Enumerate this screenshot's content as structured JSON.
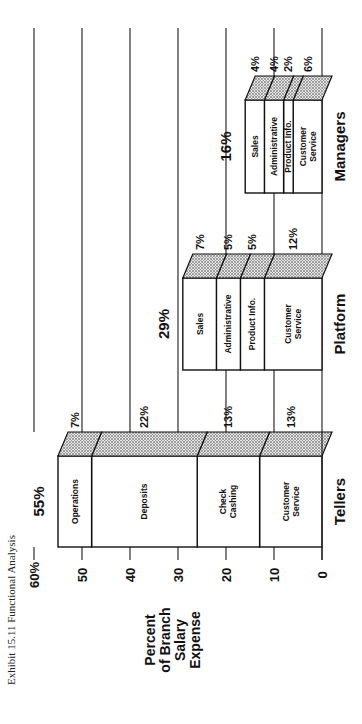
{
  "title": "Exhibit 15.11   Functional Analysis",
  "chart_data": {
    "type": "bar",
    "stacked": true,
    "orientation": "rotated-90",
    "title": "Exhibit 15.11 Functional Analysis",
    "ylabel": "Percent of Branch Salary Expense",
    "ylabel_lines": [
      "Percent",
      "of Branch",
      "Salary",
      "Expense"
    ],
    "xlabel": "",
    "ylim": [
      0,
      60
    ],
    "yticks": [
      "0",
      "10",
      "20",
      "30",
      "40",
      "50",
      "60%"
    ],
    "grid": true,
    "categories": [
      "Tellers",
      "Platform",
      "Managers"
    ],
    "totals": [
      "55%",
      "29%",
      "16%"
    ],
    "bars": [
      {
        "category": "Tellers",
        "total": 55,
        "segments": [
          {
            "name": "Customer Service",
            "lines": [
              "Customer",
              "Service"
            ],
            "value": 13,
            "label": "13%"
          },
          {
            "name": "Check Cashing",
            "lines": [
              "Check",
              "Cashing"
            ],
            "value": 13,
            "label": "13%"
          },
          {
            "name": "Deposits",
            "lines": [
              "Deposits"
            ],
            "value": 22,
            "label": "22%"
          },
          {
            "name": "Operations",
            "lines": [
              "Operations"
            ],
            "value": 7,
            "label": "7%"
          }
        ]
      },
      {
        "category": "Platform",
        "total": 29,
        "segments": [
          {
            "name": "Customer Service",
            "lines": [
              "Customer",
              "Service"
            ],
            "value": 12,
            "label": "12%"
          },
          {
            "name": "Product Info.",
            "lines": [
              "Product Info."
            ],
            "value": 5,
            "label": "5%"
          },
          {
            "name": "Administrative",
            "lines": [
              "Administrative"
            ],
            "value": 5,
            "label": "5%"
          },
          {
            "name": "Sales",
            "lines": [
              "Sales"
            ],
            "value": 7,
            "label": "7%"
          }
        ]
      },
      {
        "category": "Managers",
        "total": 16,
        "segments": [
          {
            "name": "Customer Service",
            "lines": [
              "Customer",
              "Service"
            ],
            "value": 6,
            "label": "6%"
          },
          {
            "name": "Product Info.",
            "lines": [
              "Product Info."
            ],
            "value": 2,
            "label": "2%"
          },
          {
            "name": "Administrative",
            "lines": [
              "Administrative"
            ],
            "value": 4,
            "label": "4%"
          },
          {
            "name": "Sales",
            "lines": [
              "Sales"
            ],
            "value": 4,
            "label": "4%"
          }
        ]
      }
    ]
  },
  "layout": {
    "axis_zero_x": 322,
    "px_per_unit": 4.8,
    "grid_top_y": 28,
    "grid_bottom_y": 432,
    "bars_y": [
      [
        456,
        547
      ],
      [
        278,
        370
      ],
      [
        100,
        193
      ]
    ],
    "depth": 24,
    "skew": 10
  },
  "colors": {
    "ink": "#111111",
    "background": "#ffffff",
    "shade": "#bdbdbd"
  }
}
